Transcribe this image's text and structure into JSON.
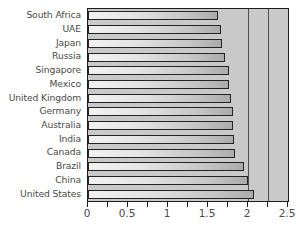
{
  "chart_data": {
    "type": "bar",
    "orientation": "horizontal",
    "title": "",
    "xlabel": "",
    "ylabel": "",
    "xlim": [
      0,
      2.5
    ],
    "grid": true,
    "legend": null,
    "categories": [
      "South Africa",
      "UAE",
      "Japan",
      "Russia",
      "Singapore",
      "Mexico",
      "United Kingdom",
      "Germany",
      "Australia",
      "India",
      "Canada",
      "Brazil",
      "China",
      "United States"
    ],
    "values": [
      1.62,
      1.66,
      1.67,
      1.71,
      1.76,
      1.76,
      1.79,
      1.81,
      1.81,
      1.83,
      1.84,
      1.95,
      2.0,
      2.07
    ],
    "xticks": [
      0,
      0.25,
      0.5,
      0.75,
      1,
      1.25,
      1.5,
      1.75,
      2,
      2.25,
      2.5
    ],
    "xtick_labels": [
      {
        "value": 0,
        "label": "0"
      },
      {
        "value": 0.5,
        "label": "0.5"
      },
      {
        "value": 1,
        "label": "1"
      },
      {
        "value": 1.5,
        "label": "1.5"
      },
      {
        "value": 2,
        "label": "2"
      },
      {
        "value": 2.5,
        "label": "2.5"
      }
    ],
    "gridline_values": [
      2,
      2.25
    ],
    "colors": {
      "plot_background": "#c9c9c9",
      "bar_light": "#f2f2f2",
      "bar_dark": "#ababab",
      "bar_border": "#242424",
      "axis": "#1d1d1d",
      "text": "#4a4a4a",
      "gridline": "#4f4f4f"
    }
  }
}
